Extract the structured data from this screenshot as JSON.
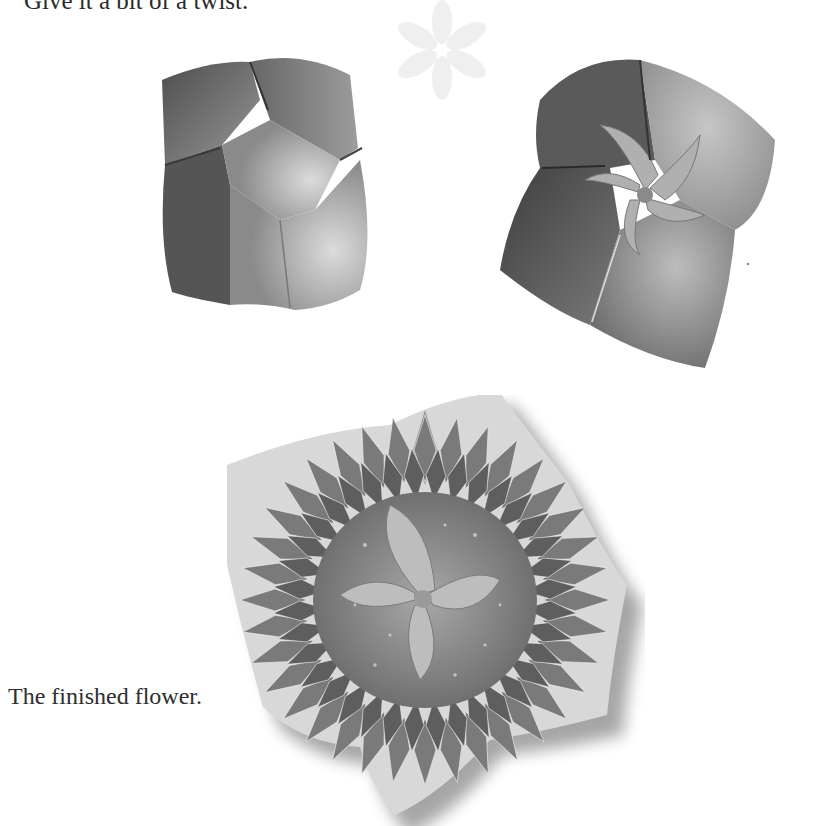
{
  "page": {
    "instruction": "Give it a bit of a twist.",
    "caption": "The finished flower."
  },
  "figures": [
    {
      "id": "step-a",
      "description": "folded paper model, untwisted"
    },
    {
      "id": "step-b",
      "description": "folded paper model with twisted center"
    },
    {
      "id": "final",
      "description": "finished origami flower with patterned petals"
    }
  ],
  "colors": {
    "background": "#ffffff",
    "text": "#2a2a2a",
    "paper_dark": "#555555",
    "paper_mid": "#8a8a8a",
    "paper_light": "#cfcfcf"
  }
}
